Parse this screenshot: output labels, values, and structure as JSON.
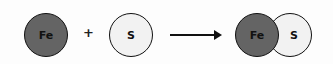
{
  "reaction": {
    "reactants": [
      {
        "symbol": "Fe",
        "color": "#646464"
      },
      {
        "symbol": "S",
        "color": "#f2f2f2"
      }
    ],
    "operator": "+",
    "arrow": "→",
    "product": [
      {
        "symbol": "Fe",
        "color": "#646464"
      },
      {
        "symbol": "S",
        "color": "#f2f2f2"
      }
    ]
  }
}
